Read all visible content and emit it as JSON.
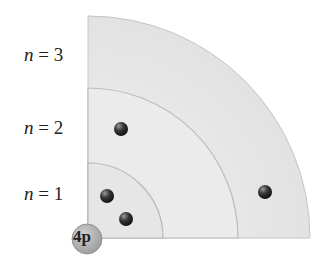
{
  "diagram": {
    "type": "bohr-model-quadrant",
    "nucleus": {
      "label": "4p",
      "color": "#b0b0b0"
    },
    "shells": [
      {
        "label_var": "n",
        "label_eq": " = ",
        "label_val": "1",
        "radius": 75,
        "electrons": 2
      },
      {
        "label_var": "n",
        "label_eq": " = ",
        "label_val": "2",
        "radius": 150,
        "electrons": 1
      },
      {
        "label_var": "n",
        "label_eq": " = ",
        "label_val": "3",
        "radius": 222,
        "electrons": 1
      }
    ],
    "colors": {
      "shell_fill": "#e9e9e9",
      "shell_edge": "#bdbdbd",
      "electron": "#2a2a2a",
      "background": "#ffffff"
    }
  }
}
